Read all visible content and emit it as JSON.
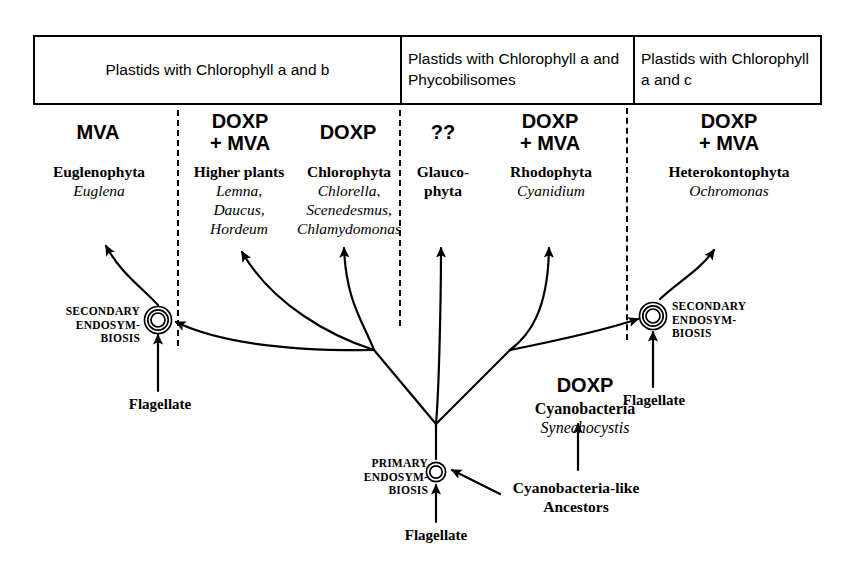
{
  "figure": {
    "type": "diagram"
  },
  "header": {
    "columns": [
      {
        "label": "Plastids with Chlorophyll a and b"
      },
      {
        "label": "Plastids with Chlorophyll\na and Phycobilisomes"
      },
      {
        "label": "Plastids with\nChlorophyll a and c"
      }
    ]
  },
  "columns": [
    {
      "pathway": "MVA",
      "genus": "Euglenophyta",
      "species": "Euglena"
    },
    {
      "pathway": "DOXP\n+ MVA",
      "genus": "Higher plants",
      "species": "Lemna,\nDaucus,\nHordeum"
    },
    {
      "pathway": "DOXP",
      "genus": "Chlorophyta",
      "species": "Chlorella,\nScenedesmus,\nChlamydomonas"
    },
    {
      "pathway": "??",
      "genus": "Glauco-\nphyta",
      "species": ""
    },
    {
      "pathway": "DOXP\n+ MVA",
      "genus": "Rhodophyta",
      "species": "Cyanidium"
    },
    {
      "pathway": "DOXP\n+ MVA",
      "genus": "Heterokontophyta",
      "species": "Ochromonas"
    }
  ],
  "events": {
    "secondary_left": "SECONDARY\nENDOSYM-\nBIOSIS",
    "secondary_right": "SECONDARY\nENDOSYM-\nBIOSIS",
    "primary": "PRIMARY\nENDOSYM-\nBIOSIS"
  },
  "flagellates": {
    "left": "Flagellate",
    "right": "Flagellate",
    "bottom": "Flagellate"
  },
  "cyanobacteria": {
    "pathway": "DOXP",
    "genus": "Cyanobacteria",
    "species": "Synechocystis"
  },
  "ancestors": {
    "label": "Cyanobacteria-like\nAncestors"
  },
  "colors": {
    "ink": "#000000",
    "background": "#ffffff"
  }
}
